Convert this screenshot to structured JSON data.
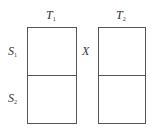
{
  "diagram": {
    "columns": [
      {
        "label": "T",
        "subscript": "1"
      },
      {
        "label": "T",
        "subscript": "2"
      }
    ],
    "rows": [
      {
        "label": "S",
        "subscript": "1"
      },
      {
        "label": "S",
        "subscript": "2"
      }
    ],
    "between_label": "X",
    "line_color": "#555555"
  }
}
